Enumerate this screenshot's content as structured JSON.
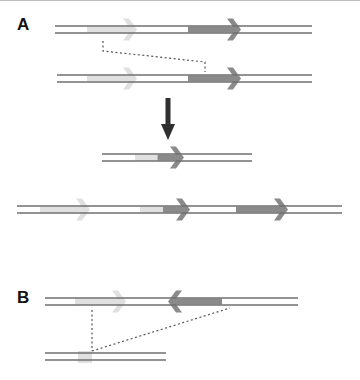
{
  "figure": {
    "panels": [
      {
        "label": "A",
        "x": 17,
        "y": 15
      },
      {
        "label": "B",
        "x": 17,
        "y": 288
      }
    ],
    "colors": {
      "strand": "#6f6f6f",
      "gene_light": "#e0e0e0",
      "gene_dark": "#8a8a8a",
      "arrow_main": "#2f2f2f",
      "dotted": "#555555"
    },
    "dna": [
      {
        "id": "A-top",
        "x1": 55,
        "x2": 312,
        "y": 26
      },
      {
        "id": "A-second",
        "x1": 57,
        "x2": 312,
        "y": 75
      },
      {
        "id": "A-product-short",
        "x1": 102,
        "x2": 252,
        "y": 154
      },
      {
        "id": "A-product-long",
        "x1": 17,
        "x2": 342,
        "y": 206
      },
      {
        "id": "B-top",
        "x1": 45,
        "x2": 298,
        "y": 298
      },
      {
        "id": "B-bottom",
        "x1": 45,
        "x2": 166,
        "y": 353
      }
    ],
    "genes": [
      {
        "strand": "A-top",
        "x1": 87,
        "x2": 133,
        "dir": "right",
        "tone": "light"
      },
      {
        "strand": "A-top",
        "x1": 188,
        "x2": 237,
        "dir": "right",
        "tone": "dark"
      },
      {
        "strand": "A-second",
        "x1": 87,
        "x2": 133,
        "dir": "right",
        "tone": "light"
      },
      {
        "strand": "A-second",
        "x1": 188,
        "x2": 237,
        "dir": "right",
        "tone": "dark"
      },
      {
        "strand": "A-product-short",
        "x1": 135,
        "x2": 180,
        "dir": "right",
        "tone": "mixed"
      },
      {
        "strand": "A-product-long",
        "x1": 40,
        "x2": 86,
        "dir": "right",
        "tone": "light"
      },
      {
        "strand": "A-product-long",
        "x1": 140,
        "x2": 186,
        "dir": "right",
        "tone": "mixed"
      },
      {
        "strand": "A-product-long",
        "x1": 236,
        "x2": 284,
        "dir": "right",
        "tone": "dark"
      },
      {
        "strand": "B-top",
        "x1": 75,
        "x2": 122,
        "dir": "right",
        "tone": "light"
      },
      {
        "strand": "B-top",
        "x1": 172,
        "x2": 222,
        "dir": "left",
        "tone": "dark"
      }
    ],
    "small_box": {
      "x": 78,
      "y": 351,
      "w": 14,
      "h": 12
    },
    "dotted_lines": [
      {
        "points": "103,41 103,51 205,62 205,72"
      },
      {
        "points": "92,310 92,351"
      },
      {
        "points": "92,351 230,308"
      }
    ],
    "down_arrow": {
      "x": 168,
      "y1": 98,
      "y2": 138
    }
  }
}
